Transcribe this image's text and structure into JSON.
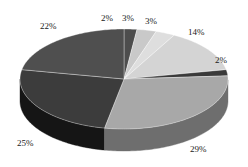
{
  "chart_data": {
    "type": "pie",
    "title": "",
    "subtitle": "",
    "xlabel": "",
    "ylabel": "",
    "grid": false,
    "legend": "none",
    "three_d": true,
    "value_suffix": "%",
    "background_color": "#ffffff",
    "label_color": "#1a1a1a",
    "categories": [
      "Slice 1",
      "Slice 2",
      "Slice 3",
      "Slice 4",
      "Slice 5",
      "Slice 6",
      "Slice 7",
      "Slice 8"
    ],
    "values": [
      2,
      3,
      3,
      14,
      2,
      29,
      25,
      22
    ],
    "labels": [
      "2%",
      "3%",
      "3%",
      "14%",
      "2%",
      "29%",
      "25%",
      "22%"
    ],
    "colors": [
      "#4d4d4d",
      "#c9c9c9",
      "#dedede",
      "#d4d4d4",
      "#3a3a3a",
      "#a8a8a8",
      "#3c3c3c",
      "#4f4f4f"
    ],
    "side_colors": [
      "#2a2a2a",
      "#8a8a8a",
      "#9c9c9c",
      "#939393",
      "#1e1e1e",
      "#6e6e6e",
      "#151515",
      "#2c2c2c"
    ],
    "total": 100,
    "start_angle_deg": -90,
    "geometry": {
      "center_x": 124,
      "center_y": 79,
      "radius_x": 104,
      "radius_y": 50,
      "depth": 22
    }
  },
  "labels_layout": [
    {
      "text": "2%",
      "left": 101,
      "top": 14
    },
    {
      "text": "3%",
      "left": 122,
      "top": 14
    },
    {
      "text": "3%",
      "left": 145,
      "top": 17
    },
    {
      "text": "14%",
      "left": 188,
      "top": 28
    },
    {
      "text": "2%",
      "left": 215,
      "top": 56
    },
    {
      "text": "29%",
      "left": 190,
      "top": 145
    },
    {
      "text": "25%",
      "left": 17,
      "top": 139
    },
    {
      "text": "22%",
      "left": 40,
      "top": 22
    }
  ]
}
